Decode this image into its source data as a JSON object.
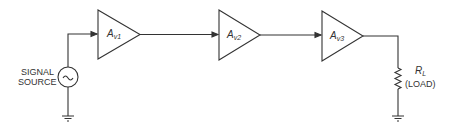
{
  "diagram": {
    "source": {
      "label_line1": "SIGNAL",
      "label_line2": "SOURCE",
      "symbol": "ac-source-tilde"
    },
    "amplifiers": [
      {
        "gain_main": "A",
        "gain_sub": "v1"
      },
      {
        "gain_main": "A",
        "gain_sub": "v2"
      },
      {
        "gain_main": "A",
        "gain_sub": "v3"
      }
    ],
    "load": {
      "label_main": "R",
      "label_sub": "L",
      "caption": "(LOAD)"
    },
    "colors": {
      "stroke": "#333333",
      "background": "#ffffff"
    }
  }
}
